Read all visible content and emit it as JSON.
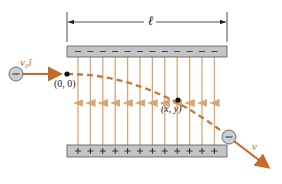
{
  "figure": {
    "labels": {
      "length": "ℓ",
      "initial_velocity": "v₀î",
      "origin": "(0, 0)",
      "point": "(x, y)",
      "final_velocity": "v",
      "electron_sign": "−",
      "top_plate_sign": "−",
      "bottom_plate_sign": "+"
    },
    "colors": {
      "field_line": "#d9a574",
      "trajectory": "#c8783a",
      "velocity_arrow": "#c56a28",
      "plate_fill": "#c4c4c4",
      "plate_border": "#555555",
      "electron_fill": "#c9ced3",
      "label_orange": "#b8652a"
    },
    "plates": {
      "top": {
        "charge": "negative",
        "sign_count": 12
      },
      "bottom": {
        "charge": "positive",
        "sign_count": 12
      }
    },
    "field_lines": {
      "count": 12,
      "direction": "up"
    }
  }
}
